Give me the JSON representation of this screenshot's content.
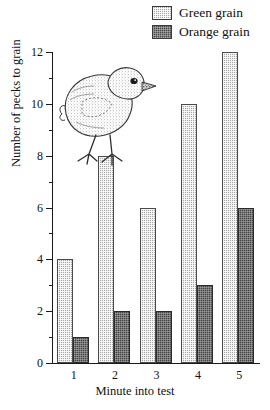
{
  "chart_data": {
    "type": "bar",
    "title": "",
    "xlabel": "Minute into test",
    "ylabel": "Number of pecks to grain",
    "categories": [
      "1",
      "2",
      "3",
      "4",
      "5"
    ],
    "series": [
      {
        "name": "Green grain",
        "values": [
          4,
          8,
          6,
          10,
          12
        ],
        "color": "#a9a9a9",
        "pattern": "light-hatch"
      },
      {
        "name": "Orange grain",
        "values": [
          1,
          2,
          2,
          3,
          6
        ],
        "color": "#474747",
        "pattern": "dark-hatch"
      }
    ],
    "ylim": [
      0,
      12
    ],
    "y_major_ticks": [
      0,
      2,
      4,
      6,
      8,
      10,
      12
    ],
    "y_minor_tick_step": 1,
    "y_tick_labels": [
      "0",
      "2",
      "4",
      "6",
      "8",
      "10",
      "12"
    ],
    "grid": false,
    "legend_position": "top-right"
  },
  "legend": {
    "items": [
      {
        "label": "Green grain",
        "swatch": "green-grain-swatch"
      },
      {
        "label": "Orange grain",
        "swatch": "orange-grain-swatch"
      }
    ]
  },
  "illustration": {
    "name": "chick-illustration",
    "description": "Halftone engraving of a baby chick standing"
  }
}
